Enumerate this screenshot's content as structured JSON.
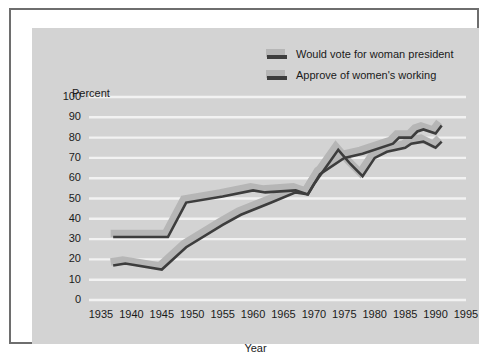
{
  "chart_data": {
    "type": "line",
    "title": "",
    "xlabel": "Year",
    "ylabel": "Percent",
    "xlim": [
      1935,
      1995
    ],
    "ylim": [
      0,
      100
    ],
    "grid": true,
    "legend_position": "top-right",
    "x_ticks": [
      "1935",
      "1940",
      "1945",
      "1950",
      "1955",
      "1960",
      "1965",
      "1970",
      "1975",
      "1980",
      "1985",
      "1990",
      "1995"
    ],
    "y_ticks": [
      "0",
      "10",
      "20",
      "30",
      "40",
      "50",
      "60",
      "70",
      "80",
      "90",
      "100"
    ],
    "series": [
      {
        "name": "Would vote for woman president",
        "color": "#3d3d3d",
        "shadow_color": "#b6b6b6",
        "x": [
          1937,
          1939,
          1945,
          1949,
          1955,
          1958,
          1963,
          1967,
          1969,
          1971,
          1975,
          1978,
          1983,
          1984,
          1986,
          1987,
          1988,
          1990,
          1991
        ],
        "y": [
          17,
          18,
          15,
          26,
          37,
          42,
          48,
          53,
          52,
          62,
          70,
          72,
          77,
          80,
          80,
          83,
          84,
          82,
          86
        ]
      },
      {
        "name": "Approve of women's working",
        "color": "#3d3d3d",
        "shadow_color": "#b6b6b6",
        "x": [
          1937,
          1938,
          1945,
          1946,
          1949,
          1955,
          1960,
          1962,
          1967,
          1969,
          1970,
          1974,
          1976,
          1978,
          1980,
          1982,
          1985,
          1986,
          1988,
          1990,
          1991
        ],
        "y": [
          31,
          31,
          31,
          31,
          48,
          51,
          54,
          53,
          54,
          52,
          57,
          74,
          67,
          61,
          70,
          73,
          75,
          77,
          78,
          75,
          78
        ]
      }
    ]
  },
  "legend": {
    "items": [
      {
        "label": "Would vote for woman president"
      },
      {
        "label": "Approve of women's working"
      }
    ]
  },
  "axes": {
    "y_title": "Percent",
    "x_title": "Year"
  },
  "colors": {
    "panel_background": "#d3d3d3",
    "page_background": "#ffffff",
    "frame_border": "#6e6e6e",
    "gridline": "#f2f2f2",
    "line": "#3d3d3d",
    "line_shadow": "#b6b6b6",
    "text": "#1a1a1a"
  }
}
